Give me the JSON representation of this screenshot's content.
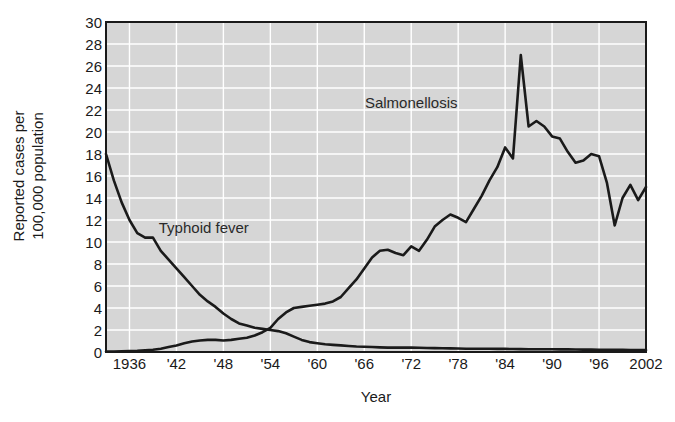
{
  "chart_data": {
    "type": "line",
    "title": "",
    "xlabel": "Year",
    "ylabel_line1": "Reported cases per",
    "ylabel_line2": "100,000 population",
    "xlim": [
      1933,
      2002
    ],
    "ylim": [
      0,
      30
    ],
    "ytick_step": 2,
    "yticks": [
      0,
      2,
      4,
      6,
      8,
      10,
      12,
      14,
      16,
      18,
      20,
      22,
      24,
      26,
      28,
      30
    ],
    "xticks": [
      1936,
      1942,
      1948,
      1954,
      1960,
      1966,
      1972,
      1978,
      1984,
      1990,
      1996,
      2002
    ],
    "xtick_labels": [
      "1936",
      "'42",
      "'48",
      "'54",
      "'60",
      "'66",
      "'72",
      "'78",
      "'84",
      "'90",
      "'96",
      "2002"
    ],
    "grid": true,
    "grid_color": "#ffffff",
    "plot_background": "#d6d6d6",
    "line_color": "#1a1a1a",
    "legend_position": "inline-annotations",
    "annotations": [
      {
        "text": "Salmonellosis",
        "x": 1972,
        "y": 22.7
      },
      {
        "text": "Typhoid fever",
        "x": 1945.5,
        "y": 11.4
      }
    ],
    "series": [
      {
        "name": "Typhoid fever",
        "x": [
          1933,
          1934,
          1935,
          1936,
          1937,
          1938,
          1939,
          1940,
          1941,
          1942,
          1943,
          1944,
          1945,
          1946,
          1947,
          1948,
          1949,
          1950,
          1951,
          1952,
          1953,
          1954,
          1955,
          1956,
          1957,
          1958,
          1959,
          1960,
          1961,
          1962,
          1963,
          1964,
          1965,
          1966,
          1967,
          1968,
          1969,
          1970,
          1971,
          1972,
          1973,
          1974,
          1975,
          1976,
          1977,
          1978,
          1979,
          1980,
          1981,
          1982,
          1983,
          1984,
          1985,
          1986,
          1987,
          1988,
          1989,
          1990,
          1991,
          1992,
          1993,
          1994,
          1995,
          1996,
          1997,
          1998,
          1999,
          2000,
          2001,
          2002
        ],
        "y": [
          18.0,
          15.6,
          13.6,
          12.0,
          10.8,
          10.4,
          10.4,
          9.2,
          8.4,
          7.6,
          6.8,
          6.0,
          5.2,
          4.6,
          4.1,
          3.5,
          3.0,
          2.6,
          2.4,
          2.2,
          2.1,
          2.0,
          1.9,
          1.7,
          1.4,
          1.1,
          0.9,
          0.8,
          0.7,
          0.65,
          0.6,
          0.55,
          0.5,
          0.48,
          0.45,
          0.42,
          0.4,
          0.4,
          0.4,
          0.4,
          0.38,
          0.36,
          0.35,
          0.34,
          0.33,
          0.32,
          0.3,
          0.3,
          0.3,
          0.3,
          0.28,
          0.28,
          0.27,
          0.26,
          0.25,
          0.25,
          0.25,
          0.25,
          0.24,
          0.24,
          0.23,
          0.22,
          0.22,
          0.2,
          0.2,
          0.2,
          0.2,
          0.18,
          0.18,
          0.17
        ]
      },
      {
        "name": "Salmonellosis",
        "x": [
          1933,
          1934,
          1935,
          1936,
          1937,
          1938,
          1939,
          1940,
          1941,
          1942,
          1943,
          1944,
          1945,
          1946,
          1947,
          1948,
          1949,
          1950,
          1951,
          1952,
          1953,
          1954,
          1955,
          1956,
          1957,
          1958,
          1959,
          1960,
          1961,
          1962,
          1963,
          1964,
          1965,
          1966,
          1967,
          1968,
          1969,
          1970,
          1971,
          1972,
          1973,
          1974,
          1975,
          1976,
          1977,
          1978,
          1979,
          1980,
          1981,
          1982,
          1983,
          1984,
          1985,
          1986,
          1987,
          1988,
          1989,
          1990,
          1991,
          1992,
          1993,
          1994,
          1995,
          1996,
          1997,
          1998,
          1999,
          2000,
          2001,
          2002
        ],
        "y": [
          0.05,
          0.05,
          0.06,
          0.08,
          0.1,
          0.15,
          0.2,
          0.3,
          0.45,
          0.6,
          0.8,
          0.95,
          1.05,
          1.1,
          1.1,
          1.05,
          1.1,
          1.2,
          1.3,
          1.5,
          1.8,
          2.2,
          3.0,
          3.6,
          4.0,
          4.1,
          4.2,
          4.3,
          4.4,
          4.6,
          5.0,
          5.8,
          6.6,
          7.6,
          8.6,
          9.2,
          9.3,
          9.0,
          8.8,
          9.6,
          9.2,
          10.2,
          11.4,
          12.0,
          12.5,
          12.2,
          11.8,
          13.0,
          14.2,
          15.6,
          16.8,
          18.6,
          17.6,
          27.0,
          20.5,
          21.0,
          20.5,
          19.6,
          19.4,
          18.2,
          17.2,
          17.4,
          18.0,
          17.8,
          15.4,
          11.5,
          14.0,
          15.2,
          13.8,
          15.0
        ]
      }
    ]
  }
}
